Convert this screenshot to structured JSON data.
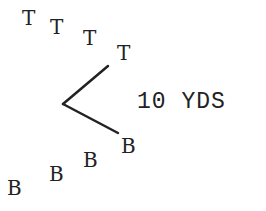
{
  "diagram": {
    "top_players": [
      {
        "label": "T",
        "x": 22,
        "y": 8
      },
      {
        "label": "T",
        "x": 50,
        "y": 17
      },
      {
        "label": "T",
        "x": 83,
        "y": 28
      },
      {
        "label": "T",
        "x": 117,
        "y": 43
      }
    ],
    "bottom_players": [
      {
        "label": "B",
        "x": 7,
        "y": 178
      },
      {
        "label": "B",
        "x": 49,
        "y": 164
      },
      {
        "label": "B",
        "x": 83,
        "y": 150
      },
      {
        "label": "B",
        "x": 121,
        "y": 136
      }
    ],
    "angle_lines": {
      "upper": {
        "x1": 108,
        "y1": 66,
        "x2": 63,
        "y2": 104
      },
      "lower": {
        "x1": 63,
        "y1": 104,
        "x2": 118,
        "y2": 133
      },
      "color": "#222222"
    },
    "distance_label": "10 YDS"
  }
}
